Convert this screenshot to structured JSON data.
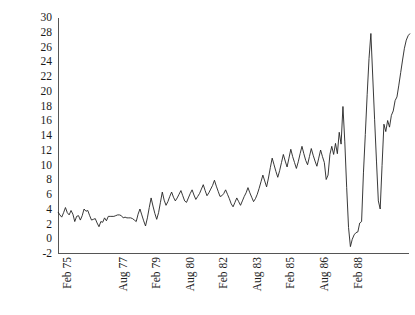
{
  "chart_data": {
    "type": "line",
    "title": "",
    "subtitle": "",
    "xlabel": "",
    "ylabel": "",
    "grid": false,
    "legend": "none",
    "ylim": [
      -2,
      30
    ],
    "y_ticks": [
      30,
      28,
      26,
      24,
      22,
      20,
      18,
      16,
      14,
      12,
      10,
      8,
      6,
      4,
      2,
      0,
      -2
    ],
    "y_tick_labels": [
      "30",
      "28",
      "26",
      "24",
      "22",
      "20",
      "18",
      "16",
      "14",
      "12",
      "10",
      "8",
      "6",
      "4",
      "2",
      "0",
      "-2"
    ],
    "x_tick_labels": [
      "Feb 75",
      "Aug 77",
      "Feb 79",
      "Aug 80",
      "Feb 82",
      "Aug 83",
      "Feb 85",
      "Aug 86",
      "Feb 88"
    ],
    "x_tick_indices": [
      0,
      30,
      48,
      66,
      84,
      102,
      120,
      138,
      156
    ],
    "series": [
      {
        "name": "series-1",
        "color": "#222222",
        "values": [
          3.7,
          3.3,
          3.0,
          3.6,
          4.3,
          3.6,
          3.3,
          3.9,
          3.4,
          2.4,
          3.1,
          3.2,
          2.6,
          3.2,
          4.1,
          3.8,
          3.9,
          3.2,
          2.6,
          2.7,
          2.8,
          2.2,
          1.7,
          2.4,
          2.3,
          2.9,
          2.5,
          3.1,
          3.1,
          3.1,
          3.1,
          3.2,
          3.3,
          3.3,
          3.2,
          2.9,
          3.0,
          2.9,
          2.9,
          2.9,
          2.8,
          2.6,
          2.4,
          3.4,
          4.1,
          3.3,
          2.5,
          1.8,
          2.9,
          4.3,
          5.6,
          4.5,
          3.5,
          2.7,
          3.6,
          5.0,
          6.4,
          5.3,
          4.6,
          5.1,
          5.8,
          6.4,
          5.7,
          5.2,
          5.6,
          6.1,
          6.6,
          5.9,
          5.2,
          5.0,
          5.6,
          6.2,
          6.7,
          6.0,
          5.4,
          5.8,
          6.2,
          6.8,
          7.4,
          6.6,
          5.9,
          6.3,
          6.8,
          7.3,
          8.0,
          7.2,
          6.5,
          5.8,
          5.9,
          6.2,
          6.7,
          6.1,
          5.5,
          4.8,
          4.4,
          5.0,
          5.6,
          5.1,
          4.6,
          5.2,
          5.8,
          6.3,
          7.0,
          6.3,
          5.7,
          5.1,
          5.5,
          6.1,
          6.9,
          7.8,
          8.7,
          7.9,
          7.1,
          8.3,
          9.7,
          11.0,
          10.1,
          9.2,
          8.4,
          9.3,
          10.4,
          11.5,
          10.6,
          9.8,
          11.0,
          12.2,
          11.2,
          10.4,
          9.6,
          10.5,
          11.6,
          12.6,
          11.6,
          10.7,
          10.1,
          11.2,
          12.3,
          11.4,
          10.6,
          9.9,
          11.0,
          12.1,
          11.2,
          10.4,
          8.1,
          8.7,
          11.5,
          12.6,
          11.5,
          13.0,
          11.6,
          14.5,
          12.9,
          18.0,
          13.2,
          7.0,
          1.6,
          -1.0,
          0.0,
          0.6,
          0.9,
          1.0,
          2.2,
          2.4,
          9.0,
          14.2,
          19.6,
          24.5,
          27.9,
          22.0,
          16.2,
          10.6,
          5.2,
          4.1,
          10.0,
          15.6,
          14.6,
          16.1,
          15.2,
          16.8,
          17.4,
          18.8,
          19.3,
          20.9,
          22.6,
          24.3,
          25.9,
          27.0,
          27.6,
          27.9
        ]
      }
    ]
  }
}
